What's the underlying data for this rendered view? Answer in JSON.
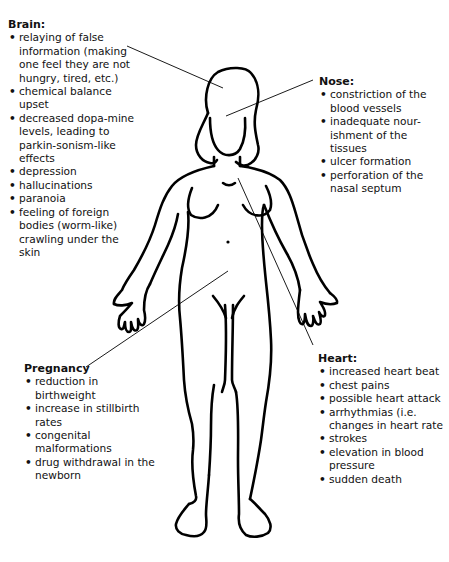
{
  "diagram": {
    "sections": {
      "brain": {
        "title": "Brain:",
        "items": [
          "relaying of false information (making one feel they are not hungry, tired, etc.)",
          "chemical balance upset",
          "decreased dopa-mine levels, leading to parkin-sonism-like effects",
          "depression",
          "hallucinations",
          "paranoia",
          "feeling of foreign bodies (worm-like) crawling under the skin"
        ]
      },
      "nose": {
        "title": "Nose:",
        "items": [
          "constriction of the blood vessels",
          "inadequate nour-ishment of the tissues",
          "ulcer formation",
          "perforation of the nasal septum"
        ]
      },
      "pregnancy": {
        "title": "Pregnancy",
        "items": [
          "reduction in birthweight",
          "increase in stillbirth rates",
          "congenital malformations",
          "drug withdrawal in the newborn"
        ]
      },
      "heart": {
        "title": "Heart:",
        "items": [
          "increased heart beat",
          "chest pains",
          "possible heart attack",
          "arrhythmias (i.e. changes in heart rate",
          "strokes",
          "elevation in blood pressure",
          "sudden death"
        ]
      }
    },
    "colors": {
      "background": "#ffffff",
      "ink": "#000000"
    }
  }
}
